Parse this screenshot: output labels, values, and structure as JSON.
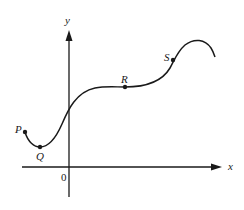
{
  "diagram": {
    "type": "function-graph",
    "axes": {
      "x_label": "x",
      "y_label": "y",
      "origin_label": "0"
    },
    "points": [
      {
        "id": "P",
        "label": "P",
        "description": "left endpoint of curve"
      },
      {
        "id": "Q",
        "label": "Q",
        "description": "local minimum"
      },
      {
        "id": "R",
        "label": "R",
        "description": "horizontal inflection / flat region"
      },
      {
        "id": "S",
        "label": "S",
        "description": "point on rising part before local maximum"
      }
    ],
    "colors": {
      "stroke": "#1a1a1a",
      "background": "#ffffff"
    }
  }
}
